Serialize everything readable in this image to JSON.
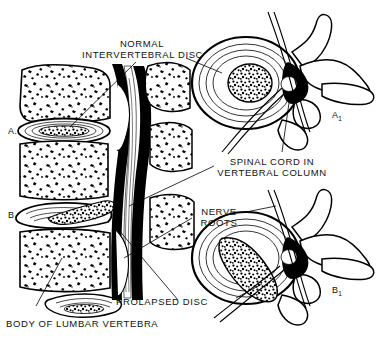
{
  "figure": {
    "background_color": "#ffffff",
    "ink_color": "#000000",
    "width": 380,
    "height": 345
  },
  "labels": {
    "normal_disc_line1": "NORMAL",
    "normal_disc_line2": "INTERVERTEBRAL DISC",
    "spinal_cord_line1": "SPINAL CORD IN",
    "spinal_cord_line2": "VERTEBRAL COLUMN",
    "nerve_roots_line1": "NERVE",
    "nerve_roots_line2": "ROOTS",
    "prolapsed_disc": "PROLAPSED DISC",
    "body_of_lumbar_vertebra": "BODY OF LUMBAR VERTEBRA"
  },
  "panels": {
    "sagittal_normal": "A.",
    "sagittal_prolapsed": "B.",
    "axial_normal_letter": "A",
    "axial_normal_subscript": "1",
    "axial_prolapsed_letter": "B",
    "axial_prolapsed_subscript": "1"
  },
  "caption": {
    "footer_text": ""
  }
}
